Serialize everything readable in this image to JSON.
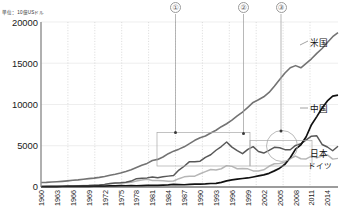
{
  "unit_label": "単位：10億USドル",
  "axis": {
    "y_ticks": [
      "20000",
      "15000",
      "10000",
      "5000",
      "0"
    ],
    "y_values": [
      20000,
      15000,
      10000,
      5000,
      0
    ],
    "x_ticks": [
      "1960",
      "1963",
      "1966",
      "1969",
      "1972",
      "1975",
      "1978",
      "1981",
      "1984",
      "1987",
      "1990",
      "1993",
      "1996",
      "1999",
      "2002",
      "2005",
      "2008",
      "2011",
      "2014"
    ]
  },
  "series_labels": {
    "usa": "米国",
    "china": "中国",
    "japan": "日本",
    "germany": "ドイツ"
  },
  "callouts": [
    {
      "id": "callout-1",
      "label": "①"
    },
    {
      "id": "callout-2",
      "label": "②"
    },
    {
      "id": "callout-3",
      "label": "③"
    }
  ],
  "colors": {
    "usa": "#6e6e6e",
    "china": "#111111",
    "japan": "#5a5a5a",
    "germany": "#b6b6b6",
    "grid": "#d8d8d8",
    "axis": "#9a9a9a",
    "annotation": "#9a9a9a"
  },
  "chart_data": {
    "type": "line",
    "title": "",
    "subtitle": "",
    "xlabel": "",
    "ylabel": "単位：10億USドル",
    "ylim": [
      0,
      20000
    ],
    "grid": true,
    "legend": "inline-right",
    "x": [
      1960,
      1961,
      1962,
      1963,
      1964,
      1965,
      1966,
      1967,
      1968,
      1969,
      1970,
      1971,
      1972,
      1973,
      1974,
      1975,
      1976,
      1977,
      1978,
      1979,
      1980,
      1981,
      1982,
      1983,
      1984,
      1985,
      1986,
      1987,
      1988,
      1989,
      1990,
      1991,
      1992,
      1993,
      1994,
      1995,
      1996,
      1997,
      1998,
      1999,
      2000,
      2001,
      2002,
      2003,
      2004,
      2005,
      2006,
      2007,
      2008,
      2009,
      2010,
      2011,
      2012,
      2013,
      2014,
      2015,
      2016
    ],
    "series": [
      {
        "name": "米国",
        "values": [
          543,
          563,
          605,
          639,
          686,
          744,
          815,
          862,
          943,
          1020,
          1076,
          1168,
          1282,
          1429,
          1546,
          1688,
          1878,
          2086,
          2357,
          2632,
          2863,
          3211,
          3345,
          3638,
          4041,
          4347,
          4590,
          4870,
          5253,
          5658,
          5980,
          6174,
          6539,
          6879,
          7309,
          7664,
          8100,
          8609,
          9089,
          9661,
          10252,
          10582,
          10936,
          11458,
          12214,
          13037,
          13815,
          14452,
          14713,
          14449,
          14992,
          15543,
          16197,
          16785,
          17522,
          18219,
          18707
        ]
      },
      {
        "name": "中国",
        "values": [
          60,
          50,
          47,
          51,
          59,
          70,
          76,
          72,
          70,
          79,
          92,
          99,
          113,
          138,
          144,
          163,
          152,
          174,
          150,
          178,
          191,
          196,
          205,
          230,
          259,
          309,
          298,
          271,
          310,
          344,
          360,
          379,
          427,
          444,
          564,
          735,
          863,
          962,
          1029,
          1094,
          1211,
          1339,
          1470,
          1660,
          1955,
          2286,
          2752,
          3552,
          4598,
          5110,
          6087,
          7552,
          8532,
          9570,
          10438,
          11016,
          11138
        ]
      },
      {
        "name": "日本",
        "values": [
          44,
          53,
          60,
          69,
          81,
          91,
          106,
          124,
          147,
          172,
          213,
          240,
          318,
          432,
          479,
          521,
          586,
          719,
          1014,
          1055,
          1105,
          1219,
          1135,
          1243,
          1319,
          1399,
          2054,
          2516,
          3072,
          3055,
          3133,
          3590,
          3908,
          4454,
          4907,
          5449,
          4834,
          4415,
          4040,
          4563,
          4888,
          4304,
          4115,
          4446,
          4815,
          4755,
          4530,
          4515,
          5038,
          5231,
          5700,
          6157,
          6203,
          5156,
          4850,
          4395,
          4940
        ]
      },
      {
        "name": "ドイツ",
        "values": [
          95,
          103,
          112,
          120,
          131,
          143,
          154,
          157,
          171,
          196,
          216,
          255,
          310,
          400,
          440,
          488,
          505,
          582,
          718,
          844,
          950,
          800,
          785,
          770,
          700,
          730,
          1010,
          1230,
          1310,
          1310,
          1600,
          1870,
          2130,
          2070,
          2210,
          2590,
          2500,
          2220,
          2240,
          2200,
          1950,
          1950,
          2080,
          2510,
          2820,
          2860,
          3000,
          3440,
          3750,
          3420,
          3400,
          3750,
          3530,
          3750,
          3890,
          3380,
          3470
        ]
      }
    ],
    "annotations": [
      {
        "name": "callout-1",
        "label": "①",
        "x_year": 1987,
        "note": "leader line down to rectangle corner"
      },
      {
        "name": "callout-2",
        "label": "②",
        "x_year": 2002,
        "note": "leader line down to rectangle edge"
      },
      {
        "name": "callout-3",
        "label": "③",
        "x_year": 2010,
        "note": "leader line down to circled crossover of 中国 and 日本"
      },
      {
        "name": "highlight-rect-1",
        "note": "rectangle spanning approx 1987-2002, 0-6500"
      },
      {
        "name": "highlight-rect-2",
        "note": "rectangle spanning approx 2002-2014, 0-4500"
      },
      {
        "name": "highlight-circle",
        "note": "circle marking China overtaking Japan around 2010"
      }
    ]
  }
}
